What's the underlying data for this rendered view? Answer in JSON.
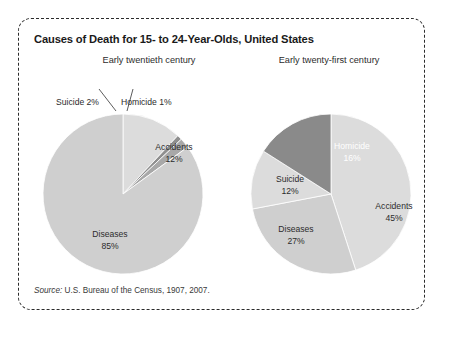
{
  "figure": {
    "title": "Causes of Death for 15- to 24-Year-Olds, United States",
    "source_label": "Source:",
    "source_text": " U.S. Bureau of the Census, 1907, 2007.",
    "border_color": "#2b2b2b",
    "background": "#ffffff"
  },
  "panels": {
    "left_header": "Early twentieth century",
    "right_header": "Early twenty-first century"
  },
  "labels": {
    "left": {
      "suicide": "Suicide 2%",
      "homicide": "Homicide 1%",
      "accidents_name": "Accidents",
      "accidents_pct": "12%",
      "diseases_name": "Diseases",
      "diseases_pct": "85%"
    },
    "right": {
      "homicide_name": "Homicide",
      "homicide_pct": "16%",
      "accidents_name": "Accidents",
      "accidents_pct": "45%",
      "diseases_name": "Diseases",
      "diseases_pct": "27%",
      "suicide_name": "Suicide",
      "suicide_pct": "12%"
    }
  },
  "chart_data": [
    {
      "type": "pie",
      "title": "Early twentieth century",
      "categories": [
        "Accidents",
        "Homicide",
        "Suicide",
        "Diseases"
      ],
      "values": [
        12,
        1,
        2,
        85
      ],
      "labels": [
        "Accidents 12%",
        "Homicide 1%",
        "Suicide 2%",
        "Diseases 85%"
      ],
      "colors": [
        "#dcdcdc",
        "#8f8f8f",
        "#a8a8a8",
        "#cfcfcf"
      ],
      "start_angle_deg": 0,
      "direction": "clockwise",
      "legend": "none",
      "grid": false,
      "external_labels": [
        "Suicide 2%",
        "Homicide 1%"
      ]
    },
    {
      "type": "pie",
      "title": "Early twenty-first century",
      "categories": [
        "Accidents",
        "Diseases",
        "Suicide",
        "Homicide"
      ],
      "values": [
        45,
        27,
        12,
        16
      ],
      "labels": [
        "Accidents 45%",
        "Diseases 27%",
        "Suicide 12%",
        "Homicide 16%"
      ],
      "colors": [
        "#dcdcdc",
        "#cfcfcf",
        "#dcdcdc",
        "#8a8a8a"
      ],
      "start_angle_deg": 0,
      "direction": "clockwise",
      "legend": "none",
      "grid": false,
      "highlight_slice": "Homicide"
    }
  ]
}
